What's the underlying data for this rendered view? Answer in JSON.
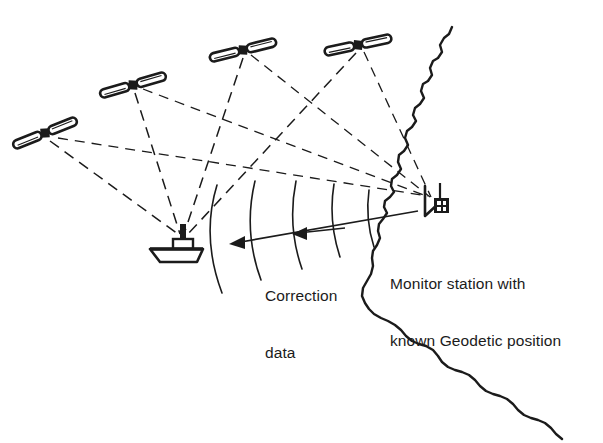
{
  "diagram": {
    "type": "dgps-principle-diagram",
    "background_color": "#ffffff",
    "ink_color": "#1b1b1b",
    "labels": {
      "correction_data_line1": "Correction",
      "correction_data_line2": "data",
      "monitor_station_line1": "Monitor station with",
      "monitor_station_line2": "known Geodetic position"
    },
    "satellites": [
      {
        "name": "satellite-1",
        "x": 45,
        "y": 133,
        "rotation": -22
      },
      {
        "name": "satellite-2",
        "x": 133,
        "y": 85,
        "rotation": -10
      },
      {
        "name": "satellite-3",
        "x": 243,
        "y": 50,
        "rotation": -6
      },
      {
        "name": "satellite-4",
        "x": 358,
        "y": 45,
        "rotation": -4
      }
    ],
    "ship": {
      "name": "ship-receiver",
      "x": 178,
      "y": 243,
      "mast_top_x": 183,
      "mast_top_y": 228
    },
    "monitor_station": {
      "name": "monitor-station",
      "antenna_x": 432,
      "antenna_y": 200,
      "receiver_box_x": 442,
      "receiver_box_y": 203
    },
    "signal_paths_to_ship": 4,
    "signal_paths_to_station": 4,
    "correction_wavefront_arcs": 5,
    "correction_arrows": 2,
    "coastline": {
      "name": "coastline",
      "description": "wiggly shoreline running from top right down to bottom right"
    }
  }
}
